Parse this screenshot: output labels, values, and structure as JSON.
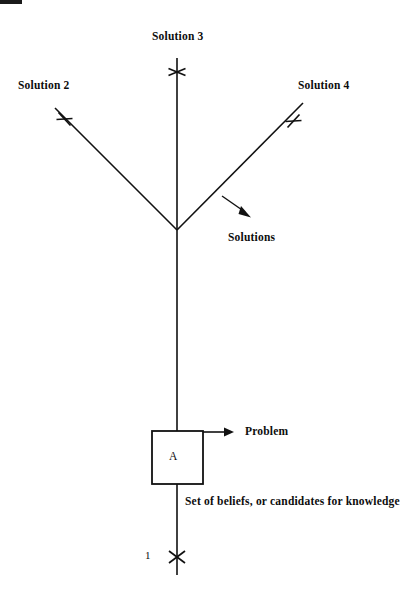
{
  "diagram": {
    "type": "tree-diagram",
    "canvas": {
      "width": 409,
      "height": 602,
      "background": "#ffffff"
    },
    "stroke_color": "#111111",
    "labels": {
      "solution_3": "Solution 3",
      "solution_2": "Solution 2",
      "solution_4": "Solution 4",
      "solutions_group": "Solutions",
      "problem": "Problem",
      "beliefs": "Set of beliefs, or candidates for knowledge",
      "trunk_number": "1",
      "box_letter": "A"
    },
    "nodes": [
      {
        "name": "box-a",
        "label": "A",
        "x": 152,
        "y": 431,
        "width": 51,
        "height": 53
      },
      {
        "name": "junction",
        "x": 177,
        "y": 230
      }
    ],
    "edges": [
      {
        "name": "trunk",
        "from": [
          177,
          575
        ],
        "to": [
          177,
          230
        ]
      },
      {
        "name": "branch-solution-3",
        "from": [
          177,
          230
        ],
        "to": [
          177,
          58
        ]
      },
      {
        "name": "branch-solution-2",
        "from": [
          177,
          230
        ],
        "to": [
          55,
          108
        ]
      },
      {
        "name": "branch-solution-4",
        "from": [
          177,
          230
        ],
        "to": [
          303,
          103
        ]
      }
    ],
    "tick_marks": [
      {
        "name": "tick-solution-3",
        "x": 177,
        "y": 72,
        "angle": 0
      },
      {
        "name": "tick-solution-2",
        "x": 64,
        "y": 119,
        "angle": 22
      },
      {
        "name": "tick-solution-4",
        "x": 293,
        "y": 121,
        "angle": -22
      },
      {
        "name": "tick-trunk-1",
        "x": 177,
        "y": 557,
        "angle": 0
      }
    ],
    "arrows": [
      {
        "name": "arrow-solutions",
        "from": [
          222,
          196
        ],
        "to": [
          250,
          217
        ]
      },
      {
        "name": "arrow-problem",
        "from": [
          203,
          432
        ],
        "to": [
          230,
          432
        ]
      }
    ]
  }
}
